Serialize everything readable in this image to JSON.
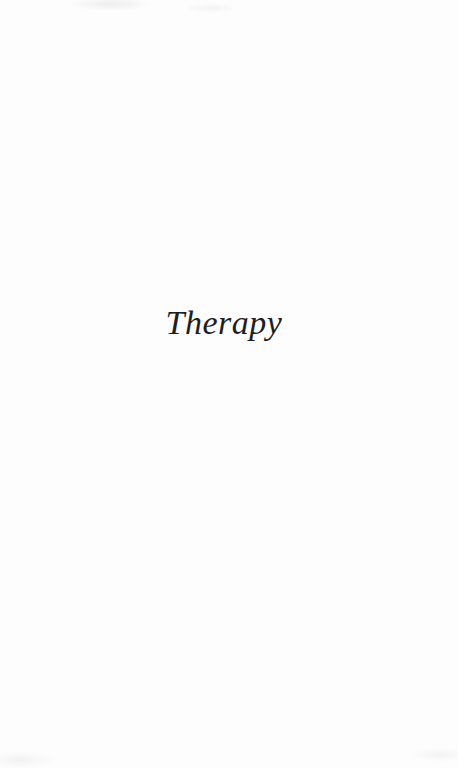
{
  "page": {
    "title": "Therapy",
    "text_color": "#1f1f1f",
    "background_color": "#fdfdfd"
  }
}
